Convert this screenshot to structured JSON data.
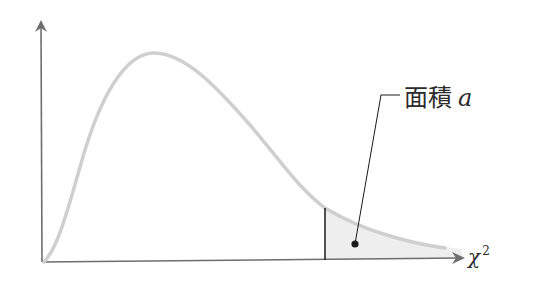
{
  "diagram": {
    "area_label": {
      "text": "面積",
      "symbol": "a"
    },
    "x_axis_label": {
      "symbol": "χ",
      "superscript": "2"
    },
    "colors": {
      "axis": "#6e6e6e",
      "curve": "#cfcfcf",
      "shade": "#ededed",
      "marker": "#1a1a1a",
      "text": "#2b2b2b"
    }
  }
}
